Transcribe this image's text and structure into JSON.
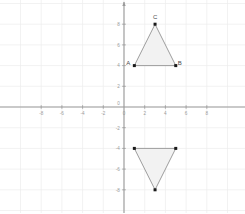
{
  "chart_data": {
    "type": "scatter",
    "title": "",
    "subtitle": "",
    "xlabel": "",
    "ylabel": "",
    "xlim": [
      -9.5,
      10.5
    ],
    "ylim": [
      -9.5,
      10.0
    ],
    "grid": true,
    "grid_step": 2,
    "legend": "none",
    "x_ticks": [
      "-8",
      "-6",
      "-4",
      "-2",
      "0",
      "2",
      "4",
      "6",
      "8"
    ],
    "x_tick_values": [
      -8,
      -6,
      -4,
      -2,
      0,
      2,
      4,
      6,
      8
    ],
    "y_ticks": [
      "8",
      "6",
      "4",
      "2",
      "0",
      "-2",
      "-4",
      "-6",
      "-8"
    ],
    "y_tick_values": [
      8,
      6,
      4,
      2,
      0,
      -2,
      -4,
      -6,
      -8
    ],
    "origin_label": "0",
    "series": [
      {
        "name": "Triangle ABC",
        "type": "polygon",
        "closed": true,
        "fill": "#f2f2f2",
        "stroke": "#8c8c8c",
        "points": [
          {
            "label": "A",
            "x": 1,
            "y": 4,
            "label_dx": -6,
            "label_dy": -1
          },
          {
            "label": "B",
            "x": 5,
            "y": 4,
            "label_dx": 4,
            "label_dy": -1
          },
          {
            "label": "C",
            "x": 3,
            "y": 8,
            "label_dx": 0,
            "label_dy": -5
          }
        ]
      },
      {
        "name": "Reflected triangle",
        "type": "polygon",
        "closed": true,
        "fill": "#f2f2f2",
        "stroke": "#8c8c8c",
        "points": [
          {
            "label": "",
            "x": 1,
            "y": -4,
            "label_dx": 0,
            "label_dy": 0
          },
          {
            "label": "",
            "x": 5,
            "y": -4,
            "label_dx": 0,
            "label_dy": 0
          },
          {
            "label": "",
            "x": 3,
            "y": -8,
            "label_dx": 0,
            "label_dy": 0
          }
        ]
      }
    ]
  },
  "colors": {
    "background": "#ffffff",
    "grid": "#ededed",
    "axis": "#9a9a9a",
    "vertex": "#1a1a1a",
    "shape_stroke": "#8c8c8c",
    "shape_fill": "#f2f2f2",
    "tick_text": "#9a9a9a",
    "vertex_text": "#4a4a4a"
  }
}
